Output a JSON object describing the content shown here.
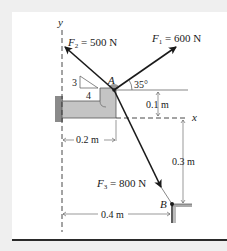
{
  "figure": {
    "axes": {
      "y_label": "y",
      "x_label": "x"
    },
    "forces": {
      "F1": {
        "symbol": "F",
        "subscript": "1",
        "value": " = 600 N",
        "angle_label": "35°"
      },
      "F2": {
        "symbol": "F",
        "subscript": "2",
        "value": " = 500 N",
        "slope_rise": "3",
        "slope_run": "4"
      },
      "F3": {
        "symbol": "F",
        "subscript": "3",
        "value": " = 800 N"
      }
    },
    "points": {
      "A": "A",
      "B": "B"
    },
    "dimensions": {
      "a_above_x": "0.1 m",
      "a_horizontal": "0.2 m",
      "b_below_x": "0.3 m",
      "b_horizontal": "0.4 m"
    },
    "colors": {
      "background": "#efefef",
      "panel": "#ffffff",
      "bracket": "#c4c4c4",
      "ink": "#1a1a1a"
    }
  }
}
